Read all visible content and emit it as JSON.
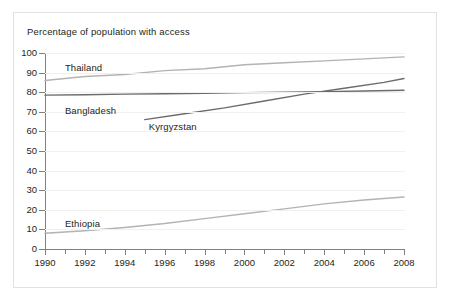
{
  "axis_title": "Percentage of population with access",
  "chart_data": {
    "type": "line",
    "title": "",
    "subtitle": "",
    "xlabel": "",
    "ylabel": "Percentage of population with access",
    "xlim": [
      1990,
      2008
    ],
    "ylim": [
      0,
      100
    ],
    "grid": true,
    "legend_position": "inline-labels",
    "x_tick_labels": [
      "1990",
      "1992",
      "1994",
      "1996",
      "1998",
      "2000",
      "2002",
      "2004",
      "2006",
      "2008"
    ],
    "x_ticks": [
      1990,
      1992,
      1994,
      1996,
      1998,
      2000,
      2002,
      2004,
      2006,
      2008
    ],
    "y_tick_labels": [
      "0",
      "10",
      "20",
      "30",
      "40",
      "50",
      "60",
      "70",
      "80",
      "90",
      "100"
    ],
    "y_ticks": [
      0,
      10,
      20,
      30,
      40,
      50,
      60,
      70,
      80,
      90,
      100
    ],
    "series": [
      {
        "name": "Thailand",
        "color": "#b3b3b3",
        "label_x": 1991.0,
        "label_y": 92.5,
        "x": [
          1990,
          1992,
          1994,
          1996,
          1998,
          2000,
          2002,
          2004,
          2006,
          2008
        ],
        "values": [
          86,
          88,
          89,
          91,
          92,
          94,
          95,
          96,
          97,
          98
        ]
      },
      {
        "name": "Bangladesh",
        "color": "#6b6b6b",
        "label_x": 1991.0,
        "label_y": 70.5,
        "x": [
          1990,
          1992,
          1994,
          1996,
          1998,
          2000,
          2002,
          2004,
          2006,
          2008
        ],
        "values": [
          78.5,
          78.7,
          79,
          79.2,
          79.5,
          79.8,
          80,
          80.3,
          80.6,
          81
        ]
      },
      {
        "name": "Kyrgyzstan",
        "color": "#6b6b6b",
        "label_x": 1995.2,
        "label_y": 62.5,
        "x": [
          1995,
          1997,
          1999,
          2001,
          2003,
          2005,
          2007,
          2008
        ],
        "values": [
          66,
          69,
          72,
          75.5,
          79,
          82,
          85,
          87
        ]
      },
      {
        "name": "Ethiopia",
        "color": "#b3b3b3",
        "label_x": 1991.0,
        "label_y": 13.0,
        "x": [
          1990,
          1992,
          1994,
          1996,
          1998,
          2000,
          2002,
          2004,
          2006,
          2008
        ],
        "values": [
          8,
          9.3,
          11,
          13,
          15.5,
          18,
          20.5,
          23,
          25,
          26.5
        ]
      }
    ]
  },
  "colors": {
    "light_series": "#b3b3b3",
    "dark_series": "#6b6b6b",
    "axis": "#808080",
    "grid": "#f0f0f0",
    "text": "#231f20",
    "frame": "#e2e2e2"
  }
}
